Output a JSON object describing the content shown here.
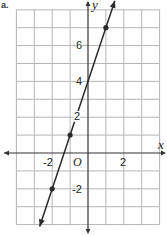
{
  "problem_label": "a.",
  "chart_data": {
    "type": "line",
    "title": "",
    "xlabel": "x",
    "ylabel": "y",
    "xlim": [
      -4,
      4
    ],
    "ylim": [
      -4,
      8
    ],
    "grid": true,
    "x_ticks_labeled": [
      -2,
      2
    ],
    "y_ticks_labeled": [
      -2,
      2,
      4,
      6
    ],
    "origin_label": "O",
    "line": {
      "slope": 3,
      "intercept": 4,
      "equation": "y = 3x + 4",
      "x_range": [
        -2.7,
        1.5
      ],
      "arrows": "both"
    },
    "points": [
      {
        "x": -2,
        "y": -2
      },
      {
        "x": -1,
        "y": 1
      },
      {
        "x": 1,
        "y": 7
      }
    ],
    "colors": {
      "grid": "#b5b5b5",
      "axis": "#333333",
      "line": "#2a2a2a"
    }
  },
  "labels": {
    "x_axis": "x",
    "y_axis": "y",
    "origin": "O",
    "x_neg2": "-2",
    "x_2": "2",
    "y_neg2": "-2",
    "y_2": "2",
    "y_4": "4",
    "y_6": "6"
  }
}
